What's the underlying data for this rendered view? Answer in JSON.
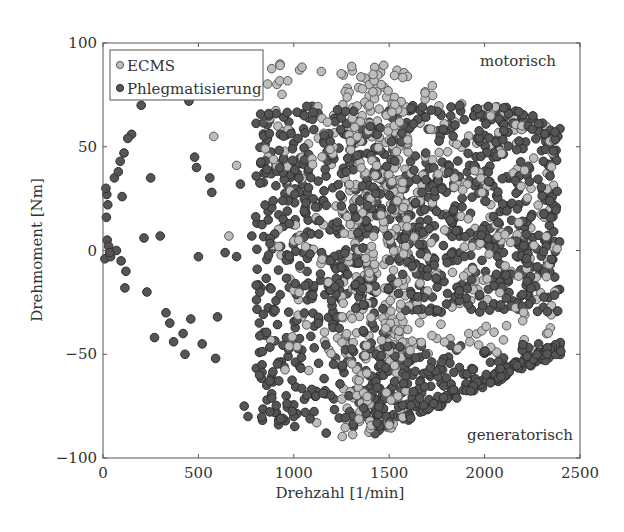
{
  "chart_data": {
    "type": "scatter",
    "title": "",
    "xlabel": "Drehzahl [1/min]",
    "ylabel": "Drehmoment [Nm]",
    "xlim": [
      0,
      2500
    ],
    "ylim": [
      -100,
      100
    ],
    "xticks": [
      0,
      500,
      1000,
      1500,
      2000,
      2500
    ],
    "yticks": [
      -100,
      -50,
      0,
      50,
      100
    ],
    "grid": false,
    "legend_position": "upper left",
    "annotations": [
      {
        "text": "motorisch",
        "x": 2300,
        "y": 90
      },
      {
        "text": "generatorisch",
        "x": 2200,
        "y": -93
      }
    ],
    "series": [
      {
        "name": "ECMS",
        "marker": "circle",
        "fill": "#bdbdbd",
        "edge": "#5a5a5a",
        "clusters": [
          {
            "x": [
              1250,
              1600
            ],
            "y": [
              -90,
              90
            ],
            "n": 360
          },
          {
            "x": [
              1500,
              2400
            ],
            "y": [
              -50,
              80
            ],
            "n": 260
          },
          {
            "x": [
              850,
              1250
            ],
            "y": [
              -60,
              90
            ],
            "n": 90
          }
        ],
        "points": [
          [
            580,
            55
          ],
          [
            700,
            41
          ],
          [
            660,
            7
          ],
          [
            1120,
            -83
          ],
          [
            1030,
            87
          ]
        ]
      },
      {
        "name": "Phlegmatisierung",
        "marker": "circle",
        "fill": "#555555",
        "edge": "#2e2e2e",
        "clusters": [
          {
            "x": [
              800,
              2400
            ],
            "y": [
              -30,
              70
            ],
            "n": 900
          },
          {
            "x": [
              800,
              1500
            ],
            "y": [
              -85,
              -30
            ],
            "n": 160
          },
          {
            "x": [
              1400,
              2400
            ],
            "y": [
              -90,
              -45
            ],
            "n": 260
          }
        ],
        "points": [
          [
            15,
            30
          ],
          [
            20,
            27
          ],
          [
            25,
            22
          ],
          [
            18,
            16
          ],
          [
            22,
            5
          ],
          [
            30,
            2
          ],
          [
            35,
            -1
          ],
          [
            10,
            -4
          ],
          [
            40,
            -3
          ],
          [
            60,
            35
          ],
          [
            80,
            38
          ],
          [
            90,
            43
          ],
          [
            110,
            47
          ],
          [
            130,
            54
          ],
          [
            150,
            56
          ],
          [
            100,
            26
          ],
          [
            70,
            0
          ],
          [
            95,
            -5
          ],
          [
            120,
            -10
          ],
          [
            115,
            -18
          ],
          [
            200,
            70
          ],
          [
            215,
            6
          ],
          [
            250,
            35
          ],
          [
            300,
            7
          ],
          [
            330,
            -30
          ],
          [
            350,
            -35
          ],
          [
            370,
            -44
          ],
          [
            420,
            -40
          ],
          [
            430,
            -50
          ],
          [
            450,
            72
          ],
          [
            460,
            -33
          ],
          [
            480,
            45
          ],
          [
            490,
            40
          ],
          [
            500,
            -3
          ],
          [
            520,
            -45
          ],
          [
            560,
            35
          ],
          [
            570,
            28
          ],
          [
            590,
            -52
          ],
          [
            600,
            -32
          ],
          [
            640,
            -1
          ],
          [
            700,
            -3
          ],
          [
            720,
            32
          ],
          [
            740,
            -75
          ],
          [
            760,
            -80
          ],
          [
            780,
            7
          ],
          [
            820,
            -60
          ],
          [
            860,
            -72
          ],
          [
            900,
            -78
          ],
          [
            920,
            -84
          ],
          [
            960,
            -70
          ],
          [
            1000,
            -80
          ],
          [
            1060,
            -78
          ],
          [
            1170,
            -88
          ],
          [
            230,
            -20
          ],
          [
            270,
            -42
          ]
        ]
      }
    ]
  }
}
